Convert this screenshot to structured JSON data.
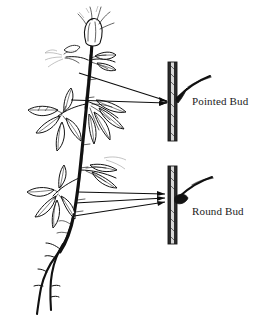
{
  "figure": {
    "kind": "botanical-line-drawing",
    "technique": "pen-and-ink hatching",
    "background_color": "#ffffff",
    "ink_color": "#111111",
    "width": 260,
    "height": 319
  },
  "labels": {
    "pointed_bud": "Pointed Bud",
    "round_bud": "Round Bud"
  },
  "insets": [
    {
      "id": "pointed-bud-inset",
      "label": "Pointed Bud",
      "description": "magnified stem segment with narrow pointed bud at base of an ascending twig",
      "stem_fill": "#2b2b2b",
      "stem_highlight": "#d8d8d8"
    },
    {
      "id": "round-bud-inset",
      "label": "Round Bud",
      "description": "magnified stem segment with plump rounded bud at base of an ascending twig",
      "stem_fill": "#2b2b2b",
      "stem_highlight": "#d8d8d8"
    }
  ],
  "leaders": {
    "pointed_group_count": 2,
    "round_group_count": 3,
    "style": "thin straight arrow lines from plant to inset"
  },
  "plant": {
    "terminal_structure": "flower bud",
    "leaf_arrangement": "whorled clusters of lance-shaped leaves",
    "lower_stem": "bare forked twigs"
  }
}
